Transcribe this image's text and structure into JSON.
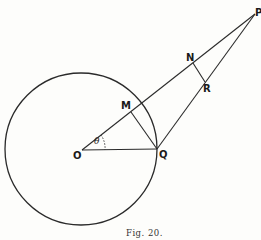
{
  "figure": {
    "caption": "Fig. 20.",
    "labels": {
      "P": "P",
      "N": "N",
      "R": "R",
      "M": "M",
      "O": "O",
      "Q": "Q",
      "theta": "θ"
    },
    "circle": {
      "center": "O",
      "passes_through": [
        "Q"
      ]
    },
    "segments": [
      "OP",
      "QP",
      "OQ",
      "MQ",
      "NR"
    ],
    "angle": {
      "vertex": "O",
      "between": [
        "OQ",
        "OP"
      ],
      "label": "θ"
    }
  }
}
